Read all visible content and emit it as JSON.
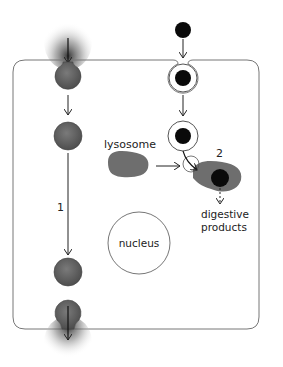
{
  "diagram": {
    "type": "cell-endocytosis-transcytosis",
    "labels": {
      "pathway_1": "1",
      "pathway_2": "2",
      "lysosome": "lysosome",
      "nucleus": "nucleus",
      "digestive_line1": "digestive",
      "digestive_line2": "products"
    },
    "colors": {
      "cell_membrane": "#777777",
      "vesicle_gray": "#6b6b6b",
      "particle_black": "#0a0a0a",
      "lysosome_gray": "#6e6e6e",
      "arrow": "#222222",
      "background": "#ffffff"
    },
    "pathways": [
      {
        "id": "1",
        "description": "transcytosis: shaded material enters at top, passes through cell in vesicles, exits at bottom"
      },
      {
        "id": "2",
        "description": "endocytosis: particle engulfed into vesicle, fuses with lysosome, yields digestive products"
      }
    ]
  }
}
